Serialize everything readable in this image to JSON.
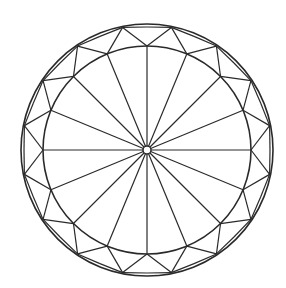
{
  "diagram": {
    "type": "gemstone-facet-diagram",
    "view": "top view of round brilliant cut",
    "canvas": {
      "width": 286,
      "height": 288,
      "background": "#ffffff"
    },
    "stroke_color": "#2a2a2a",
    "center": {
      "x": 147,
      "y": 150
    },
    "outer_circle_radius": 126,
    "inner_circle_radius": 104,
    "hub_radius": 4,
    "radial_facet_count": 16,
    "outer_ring_vertex_count": 16
  }
}
